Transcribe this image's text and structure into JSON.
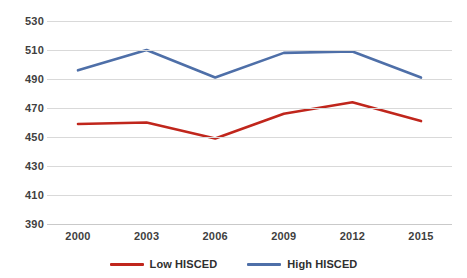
{
  "chart_data": {
    "type": "line",
    "title": "",
    "subtitle": "",
    "xlabel": "",
    "ylabel": "",
    "categories": [
      "2000",
      "2003",
      "2006",
      "2009",
      "2012",
      "2015"
    ],
    "series": [
      {
        "name": "Low HISCED",
        "color": "#C0261C",
        "values": [
          459,
          460,
          449,
          466,
          474,
          461
        ]
      },
      {
        "name": "High HISCED",
        "color": "#4E6FA8",
        "values": [
          496,
          510,
          491,
          508,
          509,
          491
        ]
      }
    ],
    "ylim": [
      390,
      530
    ],
    "ytick_step": 20,
    "yticks": [
      "530",
      "510",
      "490",
      "470",
      "450",
      "430",
      "410",
      "390"
    ],
    "grid": true,
    "grid_color": "#D9D9D9",
    "legend_position": "bottom",
    "background_color": "#FFFFFF"
  },
  "legend": {
    "items": [
      {
        "label": "Low HISCED",
        "color": "#C0261C"
      },
      {
        "label": "High HISCED",
        "color": "#4E6FA8"
      }
    ]
  }
}
